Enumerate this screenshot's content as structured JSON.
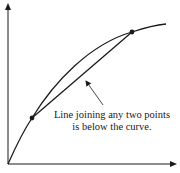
{
  "diagram": {
    "type": "concave-function-illustration",
    "axes": {
      "origin": [
        8,
        164
      ],
      "y_axis_top": [
        8,
        4
      ],
      "x_axis_right": [
        176,
        164
      ]
    },
    "curve": {
      "description": "concave increasing curve",
      "path": "M8,164 C16,146 24,130 32,118 C54,82 90,44 132,32 C144,28 155,25 166,24"
    },
    "points": [
      {
        "name": "lower-point",
        "x": 32,
        "y": 118
      },
      {
        "name": "upper-point",
        "x": 132,
        "y": 32
      }
    ],
    "chord": {
      "from": [
        32,
        118
      ],
      "to": [
        132,
        32
      ]
    },
    "annotation_arrow": {
      "from": [
        103,
        105
      ],
      "to": [
        85,
        80
      ]
    },
    "caption": {
      "line1": "Line joining any two points",
      "line2": "is below the curve."
    },
    "colors": {
      "stroke": "#1a1a1a",
      "background": "#ffffff"
    }
  }
}
